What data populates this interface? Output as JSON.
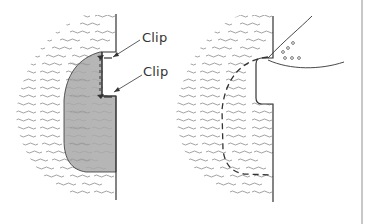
{
  "figure": {
    "left_panel": {
      "description": "Tissue cross-section with shaded excised region and two clips",
      "labels": [
        {
          "id": "clip_top",
          "text": "Clip"
        },
        {
          "id": "clip_bottom",
          "text": "Clip"
        }
      ],
      "fill_color": "#a9a9a9"
    },
    "right_panel": {
      "description": "Tissue cross-section with dashed outline of removed region and instrument with dots",
      "dashed_outline": true,
      "instrument_dots": 6
    },
    "colors": {
      "line": "#333333",
      "wave": "#8a8a8a",
      "shade": "#a9a9a9",
      "border": "#c8c8c8"
    }
  }
}
